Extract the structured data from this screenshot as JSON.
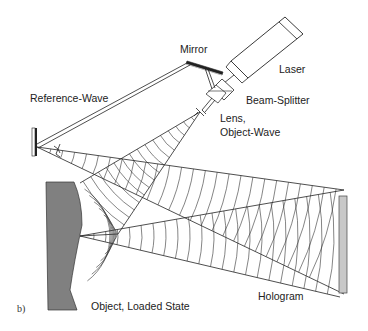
{
  "figure": {
    "panel_label": "b)",
    "labels": {
      "mirror": "Mirror",
      "laser": "Laser",
      "reference_wave": "Reference-Wave",
      "beam_splitter": "Beam-Splitter",
      "lens_line1": "Lens,",
      "lens_line2": "Object-Wave",
      "object": "Object, Loaded State",
      "hologram": "Hologram"
    },
    "colors": {
      "object_fill": "#808080",
      "hologram_fill": "#c8c8c8",
      "line": "#222222"
    },
    "components": [
      "laser",
      "beam-splitter",
      "mirror",
      "lens",
      "reference-lens",
      "object",
      "hologram"
    ]
  }
}
